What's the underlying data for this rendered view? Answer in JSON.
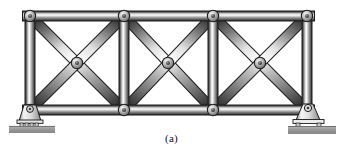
{
  "figure": {
    "caption": "(a)",
    "kind": "engineering-line-figure"
  },
  "colors": {
    "metal_dark": "#4a4a4a",
    "metal_mid": "#8f8f8f",
    "metal_light": "#f2f2f2",
    "metal_edge": "#2b2b2b",
    "joint_plate": "#b9b9b9",
    "joint_pin": "#3a3a3a",
    "ground_pad": "#9a9a9a",
    "support_body": "#e8e8e8",
    "outline": "#1c1c1c",
    "background": "#ffffff"
  },
  "geometry": {
    "top_chord_y": 16,
    "bottom_chord_y": 110,
    "mid_y": 63,
    "panel_x": [
      30,
      124,
      213,
      307
    ],
    "mid_joints_x": [
      77,
      168,
      260
    ],
    "member_width": 9,
    "joint_radius": 5.2
  },
  "joints": [
    {
      "name": "top-left",
      "x": 30,
      "y": 16
    },
    {
      "name": "top-panel-1",
      "x": 124,
      "y": 16
    },
    {
      "name": "top-panel-2",
      "x": 213,
      "y": 16
    },
    {
      "name": "top-right",
      "x": 307,
      "y": 16
    },
    {
      "name": "mid-panel-1",
      "x": 77,
      "y": 63
    },
    {
      "name": "mid-panel-2",
      "x": 168,
      "y": 63
    },
    {
      "name": "mid-panel-3",
      "x": 260,
      "y": 63
    },
    {
      "name": "bottom-left",
      "x": 30,
      "y": 110
    },
    {
      "name": "bottom-panel-1",
      "x": 124,
      "y": 110
    },
    {
      "name": "bottom-panel-2",
      "x": 213,
      "y": 110
    },
    {
      "name": "bottom-right",
      "x": 307,
      "y": 110
    }
  ],
  "members": [
    {
      "name": "top-chord",
      "type": "chord",
      "x1": 30,
      "y1": 16,
      "x2": 307,
      "y2": 16
    },
    {
      "name": "bottom-chord",
      "type": "chord",
      "x1": 30,
      "y1": 110,
      "x2": 307,
      "y2": 110
    },
    {
      "name": "vertical-left-end",
      "type": "vertical",
      "x1": 30,
      "y1": 16,
      "x2": 30,
      "y2": 110
    },
    {
      "name": "vertical-panel-1",
      "type": "vertical",
      "x1": 124,
      "y1": 16,
      "x2": 124,
      "y2": 110
    },
    {
      "name": "vertical-panel-2",
      "type": "vertical",
      "x1": 213,
      "y1": 16,
      "x2": 213,
      "y2": 110
    },
    {
      "name": "vertical-right-end",
      "type": "vertical",
      "x1": 307,
      "y1": 16,
      "x2": 307,
      "y2": 110
    },
    {
      "name": "diagonal-1-down",
      "type": "diagonal",
      "x1": 30,
      "y1": 16,
      "x2": 124,
      "y2": 110
    },
    {
      "name": "diagonal-1-up",
      "type": "diagonal",
      "x1": 124,
      "y1": 16,
      "x2": 30,
      "y2": 110
    },
    {
      "name": "diagonal-2-down",
      "type": "diagonal",
      "x1": 124,
      "y1": 16,
      "x2": 213,
      "y2": 110
    },
    {
      "name": "diagonal-2-up",
      "type": "diagonal",
      "x1": 213,
      "y1": 16,
      "x2": 124,
      "y2": 110
    },
    {
      "name": "diagonal-3-down",
      "type": "diagonal",
      "x1": 213,
      "y1": 16,
      "x2": 307,
      "y2": 110
    },
    {
      "name": "diagonal-3-up",
      "type": "diagonal",
      "x1": 307,
      "y1": 16,
      "x2": 213,
      "y2": 110
    }
  ],
  "supports": [
    {
      "name": "roller-support-left",
      "type": "roller",
      "x": 30,
      "y": 110,
      "pad": {
        "x": 10,
        "y": 125,
        "width": 44,
        "height": 7
      }
    },
    {
      "name": "pin-support-right",
      "type": "pin",
      "x": 307,
      "y": 110,
      "pad": {
        "x": 288,
        "y": 125,
        "width": 48,
        "height": 8
      }
    }
  ]
}
